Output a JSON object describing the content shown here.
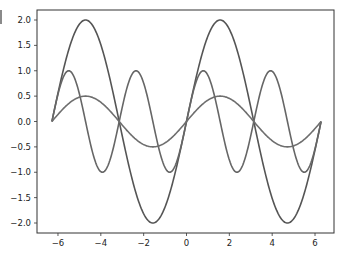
{
  "chart_data": {
    "type": "line",
    "title": "",
    "xlabel": "",
    "ylabel": "",
    "xlim": [
      -6.6,
      6.6
    ],
    "ylim": [
      -2.2,
      2.2
    ],
    "grid": false,
    "legend": null,
    "x_ticks": [
      -6,
      -4,
      -2,
      0,
      2,
      4,
      6
    ],
    "x_tick_labels": [
      "−6",
      "−4",
      "−2",
      "0",
      "2",
      "4",
      "6"
    ],
    "y_ticks": [
      2.0,
      1.5,
      1.0,
      0.5,
      0.0,
      -0.5,
      -1.0,
      -1.5,
      -2.0
    ],
    "y_tick_labels": [
      "2.0",
      "1.5",
      "1.0",
      "0.5",
      "0.0",
      "−0.5",
      "−1.0",
      "−1.5",
      "−2.0"
    ],
    "x_range": [
      -6.2832,
      6.2832
    ],
    "series": [
      {
        "name": "2*sin(x)",
        "expression": "2*sin(x)",
        "amplitude": 2.0,
        "frequency": 1,
        "color": "#555555"
      },
      {
        "name": "sin(2x)",
        "expression": "sin(2*x)",
        "amplitude": 1.0,
        "frequency": 2,
        "color": "#666666"
      },
      {
        "name": "0.5*sin(x)",
        "expression": "0.5*sin(x)",
        "amplitude": 0.5,
        "frequency": 1,
        "color": "#6e6e6e"
      }
    ]
  }
}
